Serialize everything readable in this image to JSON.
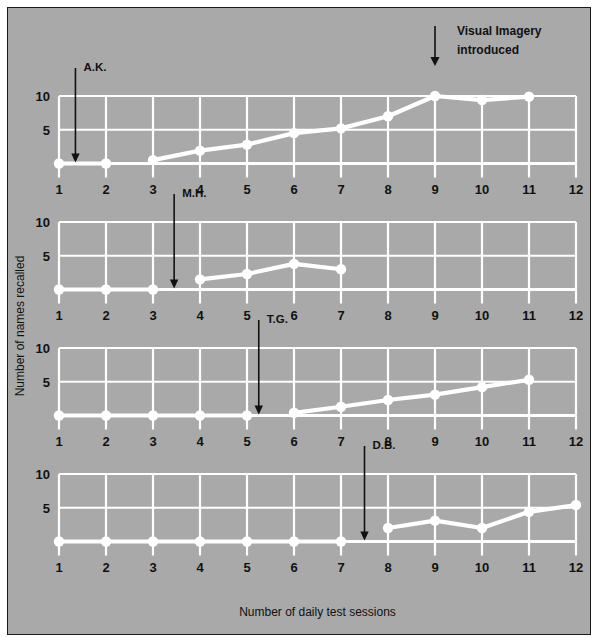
{
  "figure": {
    "annotation_label_line1": "Visual Imagery",
    "annotation_label_line2": "introduced",
    "x_axis_title": "Number of daily test sessions",
    "y_axis_title": "Number of names recalled"
  },
  "chart_data": {
    "type": "line",
    "title": "",
    "xlabel": "Number of daily test sessions",
    "ylabel": "Number of names recalled",
    "xlim": [
      1,
      12
    ],
    "ylim": [
      0,
      10
    ],
    "x": [
      1,
      2,
      3,
      4,
      5,
      6,
      7,
      8,
      9,
      10,
      11,
      12
    ],
    "xticks": [
      "1",
      "2",
      "3",
      "4",
      "5",
      "6",
      "7",
      "8",
      "9",
      "10",
      "11",
      "12"
    ],
    "yticks": [
      "5",
      "10"
    ],
    "ytickvalues": [
      5,
      10
    ],
    "grid": true,
    "legend": "none",
    "annotations": [
      {
        "text": "Visual Imagery introduced",
        "panel": 0,
        "x": 9
      },
      {
        "text": "A.K.",
        "panel": 0,
        "x": 1.35
      },
      {
        "text": "M.H.",
        "panel": 1,
        "x": 3.45
      },
      {
        "text": "T.G.",
        "panel": 2,
        "x": 5.25
      },
      {
        "text": "D.B.",
        "panel": 3,
        "x": 7.5
      }
    ],
    "panels": [
      {
        "name": "A.K.",
        "intervention_x": 1.35,
        "x": [
          1,
          2,
          3,
          4,
          5,
          6,
          7,
          8,
          9,
          10,
          11
        ],
        "values": [
          0,
          0,
          0.5,
          1.9,
          2.8,
          4.5,
          5.2,
          7.0,
          10.0,
          9.4,
          9.9
        ]
      },
      {
        "name": "M.H.",
        "intervention_x": 3.45,
        "x": [
          1,
          2,
          3,
          4,
          5,
          6,
          7
        ],
        "values": [
          0,
          0,
          0,
          1.5,
          2.3,
          3.8,
          3.0
        ]
      },
      {
        "name": "T.G.",
        "intervention_x": 5.25,
        "x": [
          1,
          2,
          3,
          4,
          5,
          6,
          7,
          8,
          9,
          10,
          11
        ],
        "values": [
          0,
          0,
          0,
          0,
          0,
          0.4,
          1.3,
          2.3,
          3.1,
          4.2,
          5.3
        ]
      },
      {
        "name": "D.B.",
        "intervention_x": 7.5,
        "x": [
          1,
          2,
          3,
          4,
          5,
          6,
          7,
          8,
          9,
          10,
          11,
          12
        ],
        "values": [
          0,
          0,
          0,
          0,
          0,
          0,
          0,
          2.0,
          3.1,
          2.0,
          4.4,
          5.4
        ]
      }
    ],
    "breaks": [
      {
        "panel": 0,
        "after_x": 2
      },
      {
        "panel": 1,
        "after_x": 3
      },
      {
        "panel": 2,
        "after_x": 5
      },
      {
        "panel": 3,
        "after_x": 7
      }
    ],
    "colors": {
      "background": "#a9a9a9",
      "grid": "#ffffff",
      "series": "#ffffff",
      "text": "#111111",
      "frame": "#1a1a1a"
    }
  }
}
